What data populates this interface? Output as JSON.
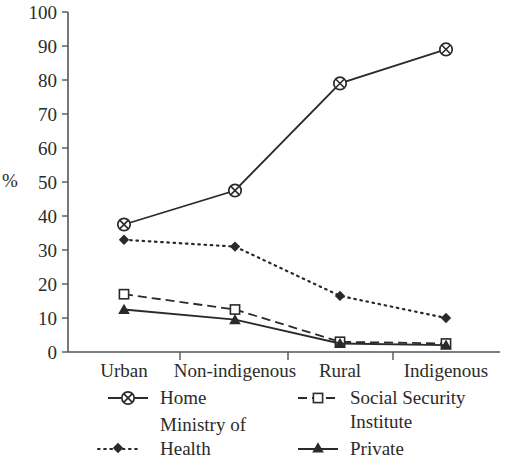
{
  "chart_data": {
    "type": "line",
    "title": "",
    "xlabel": "",
    "ylabel": "%",
    "categories": [
      "Urban",
      "Non-indigenous",
      "Rural",
      "Indigenous"
    ],
    "ylim": [
      0,
      100
    ],
    "y_ticks": [
      0,
      10,
      20,
      30,
      40,
      50,
      60,
      70,
      80,
      90,
      100
    ],
    "grid": false,
    "legend_position": "bottom",
    "series": [
      {
        "name": "Home",
        "values": [
          37.5,
          47.5,
          79,
          89
        ],
        "marker": "circle-cross",
        "line_style": "solid",
        "color": "#2a2a2a"
      },
      {
        "name": "Social Security Institute",
        "values": [
          17,
          12.5,
          3,
          2.5
        ],
        "marker": "open-square",
        "line_style": "dashed",
        "color": "#2a2a2a"
      },
      {
        "name": "Ministry of Health",
        "values": [
          33,
          31,
          16.5,
          10
        ],
        "marker": "filled-diamond",
        "line_style": "dotted",
        "color": "#2a2a2a"
      },
      {
        "name": "Private",
        "values": [
          12.5,
          9.5,
          2.5,
          2
        ],
        "marker": "filled-triangle",
        "line_style": "solid",
        "color": "#2a2a2a"
      }
    ]
  },
  "axis": {
    "y_label": "%",
    "y_tick_labels": [
      "100",
      "90",
      "80",
      "70",
      "60",
      "50",
      "40",
      "30",
      "20",
      "10",
      "0"
    ],
    "x_tick_labels": [
      "Urban",
      "Non-indigenous",
      "Rural",
      "Indigenous"
    ]
  },
  "legend": {
    "entries": [
      {
        "label": "Home",
        "icon": "circle-cross-marker-icon"
      },
      {
        "label": "Social Security",
        "label2": "Institute",
        "icon": "open-square-marker-icon"
      },
      {
        "label": "Ministry of",
        "label2": "Health",
        "icon": "filled-diamond-marker-icon"
      },
      {
        "label": "Private",
        "icon": "filled-triangle-marker-icon"
      }
    ]
  }
}
